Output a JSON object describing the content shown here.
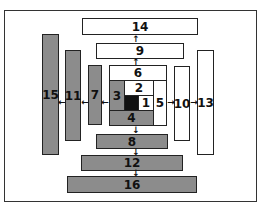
{
  "diagram": {
    "type": "nested-spiral-blocks",
    "colors": {
      "gray": "#8c8c8c",
      "white": "#ffffff",
      "black": "#111111",
      "border": "#222222"
    },
    "blocks": [
      {
        "id": "1",
        "label": "1",
        "fill": "white"
      },
      {
        "id": "center",
        "label": "",
        "fill": "black"
      },
      {
        "id": "2",
        "label": "2",
        "fill": "white"
      },
      {
        "id": "3",
        "label": "3",
        "fill": "gray"
      },
      {
        "id": "4",
        "label": "4",
        "fill": "gray"
      },
      {
        "id": "5",
        "label": "5",
        "fill": "white"
      },
      {
        "id": "6",
        "label": "6",
        "fill": "white"
      },
      {
        "id": "7",
        "label": "7",
        "fill": "gray"
      },
      {
        "id": "8",
        "label": "8",
        "fill": "gray"
      },
      {
        "id": "9",
        "label": "9",
        "fill": "white"
      },
      {
        "id": "10",
        "label": "10",
        "fill": "white"
      },
      {
        "id": "11",
        "label": "11",
        "fill": "gray"
      },
      {
        "id": "12",
        "label": "12",
        "fill": "gray"
      },
      {
        "id": "13",
        "label": "13",
        "fill": "white"
      },
      {
        "id": "14",
        "label": "14",
        "fill": "white"
      },
      {
        "id": "15",
        "label": "15",
        "fill": "gray"
      },
      {
        "id": "16",
        "label": "16",
        "fill": "gray"
      }
    ],
    "arrows": {
      "up": "↑",
      "down": "↓",
      "left": "←",
      "right": "→"
    },
    "edges": [
      {
        "from": "6",
        "to": "10",
        "dir": "up"
      },
      {
        "from": "10",
        "to": "14",
        "dir": "up"
      },
      {
        "from": "3",
        "to": "7",
        "dir": "left"
      },
      {
        "from": "7",
        "to": "11",
        "dir": "left"
      },
      {
        "from": "11",
        "to": "15",
        "dir": "left"
      },
      {
        "from": "5",
        "to": "9",
        "dir": "right"
      },
      {
        "from": "9",
        "to": "13",
        "dir": "right"
      },
      {
        "from": "4",
        "to": "8",
        "dir": "down"
      },
      {
        "from": "8",
        "to": "12",
        "dir": "down"
      },
      {
        "from": "12",
        "to": "16",
        "dir": "down"
      }
    ]
  }
}
